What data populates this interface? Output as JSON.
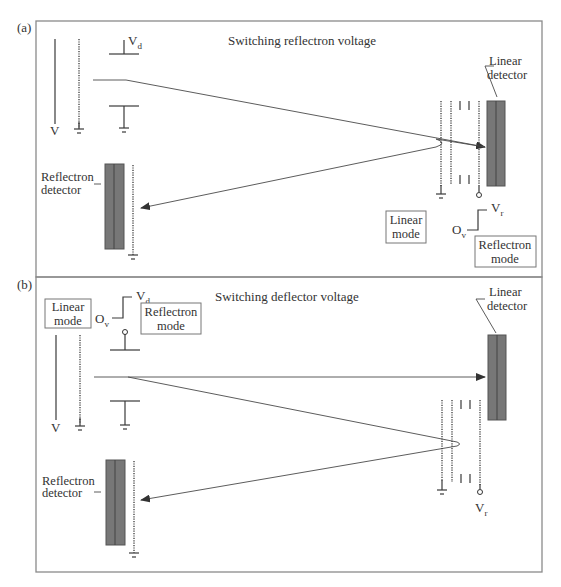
{
  "panels": [
    {
      "label": "(a)",
      "title": "Switching reflectron voltage",
      "linear_detector": {
        "line1": "Linear",
        "line2": "detector"
      },
      "reflectron_detector": {
        "line1": "Reflectron",
        "line2": "detector"
      },
      "source_voltage": "V",
      "deflector_voltage": {
        "main": "V",
        "sub": "d"
      },
      "reflectron_voltage": {
        "main": "V",
        "sub": "r"
      },
      "offset_voltage": {
        "main": "O",
        "sub": "v"
      },
      "mode_boxes": [
        {
          "line1": "Linear",
          "line2": "mode"
        },
        {
          "line1": "Reflectron",
          "line2": "mode"
        }
      ]
    },
    {
      "label": "(b)",
      "title": "Switching deflector voltage",
      "linear_detector": {
        "line1": "Linear",
        "line2": "detector"
      },
      "reflectron_detector": {
        "line1": "Reflectron",
        "line2": "detector"
      },
      "source_voltage": "V",
      "deflector_voltage": {
        "main": "V",
        "sub": "d"
      },
      "reflectron_voltage": {
        "main": "V",
        "sub": "r"
      },
      "offset_voltage": {
        "main": "O",
        "sub": "v"
      },
      "mode_boxes": [
        {
          "line1": "Linear",
          "line2": "mode"
        },
        {
          "line1": "Reflectron",
          "line2": "mode"
        }
      ]
    }
  ],
  "colors": {
    "detector_fill": "#777777",
    "frame": "#8a8a8a",
    "line": "#3a3a3a"
  }
}
